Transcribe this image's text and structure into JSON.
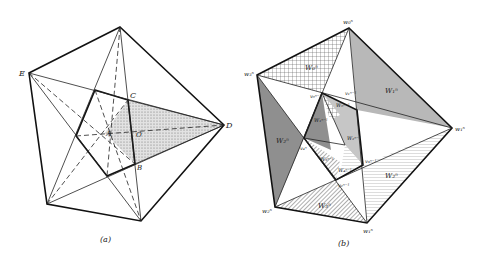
{
  "figure": {
    "panels": [
      {
        "id": "a",
        "caption": "(a)",
        "vertex_labels": {
          "E": "E",
          "C": "C",
          "D": "D",
          "B": "B",
          "A": "A",
          "O": "O"
        },
        "shaded_region": "triangle C-D-B (stippled)"
      },
      {
        "id": "b",
        "caption": "(b)",
        "vertex_labels": {
          "top": "w₀ⁿ",
          "left": "w₃ⁿ",
          "right": "w₁ⁿ",
          "bottom_left": "w₂ⁿ",
          "bottom": "w₁ⁿ",
          "inner_top_left": "v₀ⁿ⁻¹",
          "inner_top": "v₁ⁿ⁻¹",
          "inner_left": "v₄ⁿ",
          "inner_bottom": "v₂ⁿ⁻¹",
          "inner_right": "v₃ⁿ⁻¹"
        },
        "region_labels": {
          "top_left": "W₀ⁿ",
          "top_right": "W₁ⁿ",
          "left": "W₂ⁿ",
          "bottom": "W₃ⁿ",
          "bottom_right": "W₂ⁿ",
          "inner_1": "W₀ⁿ⁻¹",
          "inner_2": "W₁ⁿ⁻¹",
          "inner_3": "W₂ⁿ⁻¹",
          "inner_4": "W₃ⁿ⁻¹",
          "inner_5": "W₄ⁿ⁻¹"
        }
      }
    ]
  },
  "colors": {
    "line": "#111111",
    "shade_light": "#d9d9d9",
    "shade_dark": "#9a9a9a",
    "shade_mid": "#b5b5b5"
  }
}
